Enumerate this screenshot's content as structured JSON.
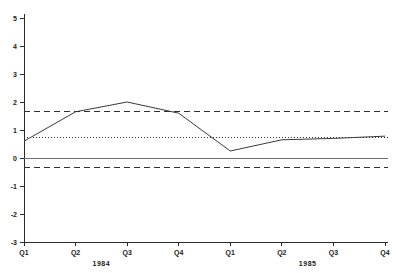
{
  "chart_data": {
    "type": "line",
    "title": "",
    "subtitle": "",
    "xlabel": "",
    "ylabel": "",
    "grid": false,
    "legend_position": "none",
    "ylim": [
      -3,
      5
    ],
    "y_ticks": [
      5,
      4,
      3,
      2,
      1,
      0,
      -1,
      -2,
      -3
    ],
    "y_tick_labels": [
      "5",
      "4",
      "3",
      "2",
      "1",
      "0",
      "-1",
      "-2",
      "-3"
    ],
    "categories": [
      "Q1",
      "Q2",
      "Q3",
      "Q4",
      "Q1",
      "Q2",
      "Q3",
      "Q4"
    ],
    "x_group_labels": [
      "1984",
      "1985"
    ],
    "x_group_spans": [
      [
        0,
        3
      ],
      [
        4,
        7
      ]
    ],
    "series": [
      {
        "name": "observed",
        "style": "solid",
        "values": [
          0.6,
          1.65,
          2.0,
          1.6,
          0.25,
          0.65,
          0.7,
          0.78
        ]
      },
      {
        "name": "upper-band",
        "style": "dashed",
        "constant": 1.65,
        "values": [
          1.65,
          1.65,
          1.65,
          1.65,
          1.65,
          1.65,
          1.65,
          1.65
        ]
      },
      {
        "name": "mean-reference",
        "style": "dotted",
        "constant": 0.75,
        "values": [
          0.75,
          0.75,
          0.75,
          0.75,
          0.75,
          0.75,
          0.75,
          0.75
        ]
      },
      {
        "name": "zero-reference",
        "style": "thin-solid",
        "constant": 0.0,
        "values": [
          0,
          0,
          0,
          0,
          0,
          0,
          0,
          0
        ]
      },
      {
        "name": "lower-band",
        "style": "dashed",
        "constant": -0.35,
        "values": [
          -0.35,
          -0.35,
          -0.35,
          -0.35,
          -0.35,
          -0.35,
          -0.35,
          -0.35
        ]
      }
    ],
    "colors": {
      "axis": "#2b2b2b",
      "observed": "#3a3a3a",
      "band": "#2f2f2f",
      "zero": "#6e6e6e",
      "background": "#ffffff"
    }
  }
}
